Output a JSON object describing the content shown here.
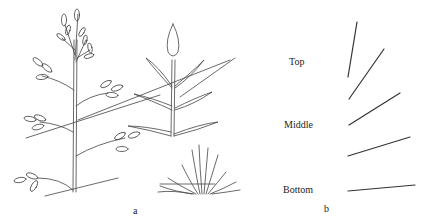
{
  "figure": {
    "panel_a": {
      "label": "a",
      "subjects": [
        "branched-plant-with-buds",
        "leafy-stem-plant",
        "rosette-plant"
      ]
    },
    "panel_b": {
      "label": "b",
      "positions": [
        {
          "label": "Top"
        },
        {
          "label": "Middle"
        },
        {
          "label": "Bottom"
        }
      ],
      "line_count": 6
    },
    "colors": {
      "ink": "#333333",
      "background": "#ffffff"
    }
  }
}
